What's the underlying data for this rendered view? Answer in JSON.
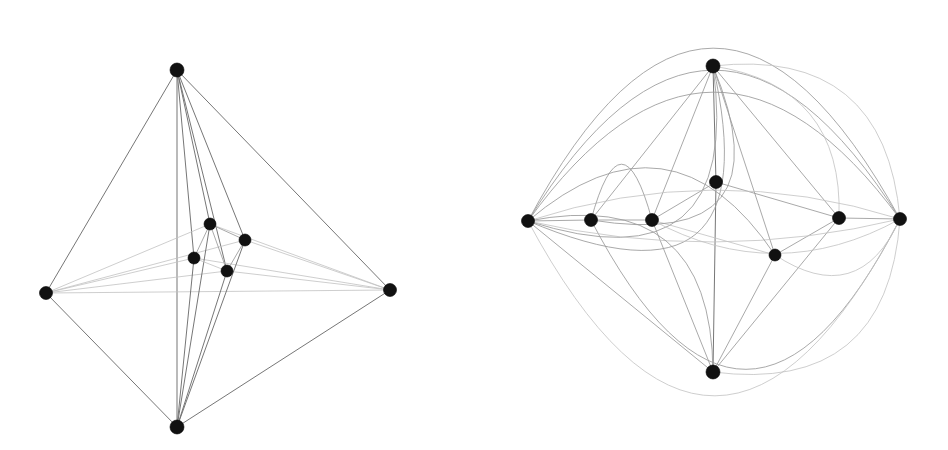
{
  "figure": {
    "background_color": "#ffffff",
    "vertex_color": "#111111",
    "edge_color": "#9a9a9a",
    "faint_edge_color": "#c2c2c2",
    "strong_edge_color": "#6f6f6f",
    "width": 948,
    "height": 450,
    "panel_count": 2
  },
  "chart_data": {
    "type": "diagram",
    "panels": [
      {
        "name": "left-panel",
        "label": "3D octahedral projection drawing",
        "vertex_radius": 6.5,
        "vertices": [
          {
            "id": "L1",
            "label": "top",
            "x": 177,
            "y": 70,
            "r": 7.0
          },
          {
            "id": "L2",
            "label": "left",
            "x": 46,
            "y": 293,
            "r": 6.5
          },
          {
            "id": "L3",
            "label": "right",
            "x": 390,
            "y": 290,
            "r": 6.5
          },
          {
            "id": "L4",
            "label": "bottom",
            "x": 177,
            "y": 427,
            "r": 7.0
          },
          {
            "id": "L5",
            "label": "inner-upper",
            "x": 210,
            "y": 224,
            "r": 6.0
          },
          {
            "id": "L6",
            "label": "inner-right",
            "x": 245,
            "y": 240,
            "r": 6.0
          },
          {
            "id": "L7",
            "label": "inner-left",
            "x": 194,
            "y": 258,
            "r": 6.0
          },
          {
            "id": "L8",
            "label": "inner-lower",
            "x": 227,
            "y": 271,
            "r": 6.0
          }
        ],
        "edges": [
          {
            "from": "L1",
            "to": "L2",
            "style": "strong"
          },
          {
            "from": "L1",
            "to": "L3",
            "style": "strong"
          },
          {
            "from": "L1",
            "to": "L4",
            "style": "strong"
          },
          {
            "from": "L1",
            "to": "L5",
            "style": "strong"
          },
          {
            "from": "L1",
            "to": "L6",
            "style": "strong"
          },
          {
            "from": "L1",
            "to": "L7",
            "style": "strong"
          },
          {
            "from": "L1",
            "to": "L8",
            "style": "strong"
          },
          {
            "from": "L2",
            "to": "L4",
            "style": "strong"
          },
          {
            "from": "L2",
            "to": "L3",
            "style": "faint"
          },
          {
            "from": "L2",
            "to": "L5",
            "style": "faint"
          },
          {
            "from": "L2",
            "to": "L6",
            "style": "faint"
          },
          {
            "from": "L2",
            "to": "L7",
            "style": "faint"
          },
          {
            "from": "L2",
            "to": "L8",
            "style": "faint"
          },
          {
            "from": "L3",
            "to": "L4",
            "style": "strong"
          },
          {
            "from": "L3",
            "to": "L5",
            "style": "faint"
          },
          {
            "from": "L3",
            "to": "L6",
            "style": "faint"
          },
          {
            "from": "L3",
            "to": "L7",
            "style": "faint"
          },
          {
            "from": "L3",
            "to": "L8",
            "style": "faint"
          },
          {
            "from": "L4",
            "to": "L5",
            "style": "strong"
          },
          {
            "from": "L4",
            "to": "L6",
            "style": "strong"
          },
          {
            "from": "L4",
            "to": "L7",
            "style": "strong"
          },
          {
            "from": "L4",
            "to": "L8",
            "style": "strong"
          },
          {
            "from": "L5",
            "to": "L6",
            "style": "normal"
          },
          {
            "from": "L5",
            "to": "L7",
            "style": "normal"
          },
          {
            "from": "L5",
            "to": "L8",
            "style": "normal"
          },
          {
            "from": "L6",
            "to": "L8",
            "style": "normal"
          },
          {
            "from": "L7",
            "to": "L8",
            "style": "faint"
          }
        ]
      },
      {
        "name": "right-panel",
        "label": "Planar embedding drawing with curved arcs",
        "vertex_radius": 6.5,
        "vertices": [
          {
            "id": "R1",
            "label": "top",
            "x": 239,
            "y": 66,
            "r": 7.0
          },
          {
            "id": "R2",
            "label": "bottom",
            "x": 239,
            "y": 372,
            "r": 7.0
          },
          {
            "id": "R3",
            "label": "far-left",
            "x": 54,
            "y": 221,
            "r": 6.5
          },
          {
            "id": "R4",
            "label": "inner-left",
            "x": 117,
            "y": 220,
            "r": 6.5
          },
          {
            "id": "R5",
            "label": "mid-left",
            "x": 178,
            "y": 220,
            "r": 6.5
          },
          {
            "id": "R6",
            "label": "center",
            "x": 242,
            "y": 182,
            "r": 6.5
          },
          {
            "id": "R7",
            "label": "center-lower",
            "x": 301,
            "y": 255,
            "r": 6.0
          },
          {
            "id": "R8",
            "label": "mid-right",
            "x": 365,
            "y": 218,
            "r": 6.5
          },
          {
            "id": "R9",
            "label": "far-right",
            "x": 426,
            "y": 219,
            "r": 6.5
          }
        ],
        "straight_edges": [
          {
            "from": "R1",
            "to": "R6",
            "style": "strong"
          },
          {
            "from": "R6",
            "to": "R2",
            "style": "strong"
          },
          {
            "from": "R3",
            "to": "R4",
            "style": "normal"
          },
          {
            "from": "R4",
            "to": "R5",
            "style": "normal"
          },
          {
            "from": "R5",
            "to": "R6",
            "style": "normal"
          },
          {
            "from": "R6",
            "to": "R8",
            "style": "normal"
          },
          {
            "from": "R8",
            "to": "R9",
            "style": "normal"
          },
          {
            "from": "R1",
            "to": "R5",
            "style": "normal"
          },
          {
            "from": "R1",
            "to": "R4",
            "style": "normal"
          },
          {
            "from": "R1",
            "to": "R8",
            "style": "normal"
          },
          {
            "from": "R1",
            "to": "R7",
            "style": "normal"
          },
          {
            "from": "R2",
            "to": "R5",
            "style": "normal"
          },
          {
            "from": "R2",
            "to": "R7",
            "style": "normal"
          },
          {
            "from": "R2",
            "to": "R8",
            "style": "normal"
          },
          {
            "from": "R5",
            "to": "R7",
            "style": "faint"
          },
          {
            "from": "R7",
            "to": "R8",
            "style": "normal"
          },
          {
            "from": "R3",
            "to": "R2",
            "style": "normal"
          }
        ],
        "curved_edges": [
          {
            "from": "R3",
            "to": "R1",
            "bow": -118,
            "style": "normal",
            "note": "outer arc 1 over top"
          },
          {
            "from": "R3",
            "to": "R1",
            "bow": -96,
            "style": "normal",
            "note": "outer arc 2 over top"
          },
          {
            "from": "R4",
            "to": "R1",
            "bow": -88,
            "style": "normal",
            "note": "outer arc 3 over top"
          },
          {
            "from": "R4",
            "to": "R9",
            "bow": -150,
            "style": "normal",
            "note": "long arc over the whole figure"
          },
          {
            "from": "R3",
            "to": "R9",
            "bow": -176,
            "style": "faint",
            "note": "outermost arc over the top"
          },
          {
            "from": "R5",
            "to": "R9",
            "bow": -34,
            "style": "faint",
            "note": "shallow arc above centre"
          },
          {
            "from": "R3",
            "to": "R9",
            "bow": -22,
            "style": "faint",
            "note": "shallow arc just above mid-line"
          },
          {
            "from": "R3",
            "to": "R9",
            "bow": 30,
            "style": "faint",
            "note": "shallow arc just below mid-line"
          },
          {
            "from": "R4",
            "to": "R5",
            "bow": 56,
            "style": "normal",
            "note": "small downward loop between left pair"
          },
          {
            "from": "R3",
            "to": "R7",
            "bow": 70,
            "style": "normal",
            "note": "sweeping arc to centre-lower"
          },
          {
            "from": "R3",
            "to": "R2",
            "bow": 72,
            "style": "normal",
            "note": "sweeping arc to bottom"
          },
          {
            "from": "R3",
            "to": "R9",
            "bow": 128,
            "style": "normal",
            "note": "outer arc 1 under bottom"
          },
          {
            "from": "R3",
            "to": "R9",
            "bow": 150,
            "style": "normal",
            "note": "outer arc 2 under bottom"
          },
          {
            "from": "R3",
            "to": "R9",
            "bow": 172,
            "style": "normal",
            "note": "outer arc 3 under bottom"
          },
          {
            "from": "R9",
            "to": "R2",
            "bow": 64,
            "style": "faint",
            "note": "arc from far-right to bottom"
          },
          {
            "from": "R9",
            "to": "R1",
            "bow": -62,
            "style": "faint",
            "note": "arc from far-right to top"
          },
          {
            "from": "R8",
            "to": "R1",
            "bow": -44,
            "style": "faint",
            "note": "arc from mid-right to top"
          },
          {
            "from": "R9",
            "to": "R7",
            "bow": 38,
            "style": "faint",
            "note": "arc from far-right to centre-lower"
          }
        ]
      }
    ]
  }
}
